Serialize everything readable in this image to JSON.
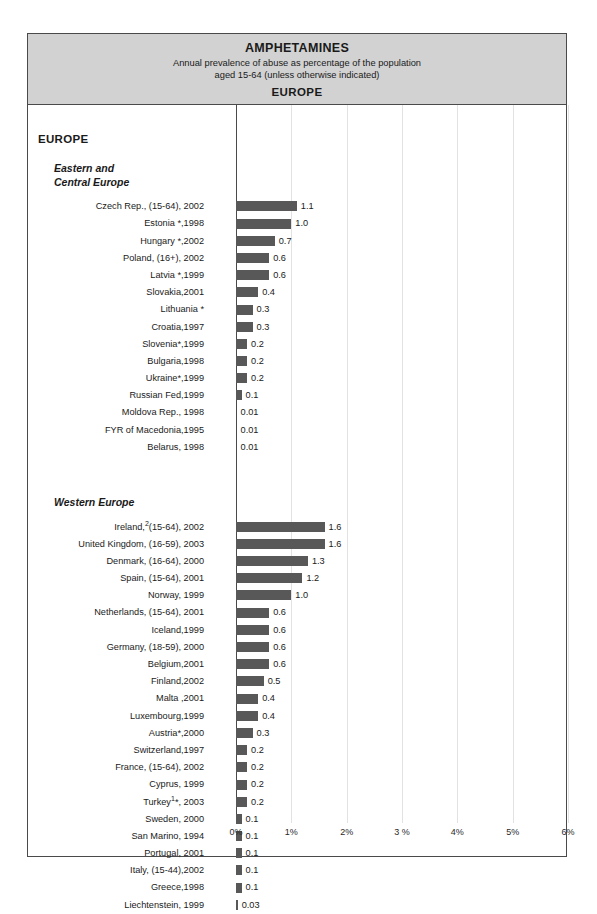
{
  "header": {
    "title": "AMPHETAMINES",
    "subtitle_line1": "Annual prevalence of abuse as percentage of the population",
    "subtitle_line2": "aged 15-64 (unless otherwise indicated)",
    "region": "EUROPE"
  },
  "colors": {
    "bar": "#585858",
    "header_background": "#d2d2d2",
    "frame_border": "#4a4a4a",
    "gridline": "#e2e2e2"
  },
  "sections": {
    "region_label": "EUROPE",
    "group1_line1": "Eastern and",
    "group1_line2": "Central Europe",
    "group2": "Western Europe"
  },
  "chart_data": {
    "type": "bar",
    "orientation": "horizontal",
    "title": "AMPHETAMINES",
    "subtitle": "Annual prevalence of abuse as percentage of the population aged 15-64 (unless otherwise indicated)",
    "region": "EUROPE",
    "xlabel": "",
    "ylabel": "",
    "xlim": [
      0,
      6
    ],
    "xticks": [
      0,
      1,
      2,
      3,
      4,
      5,
      6
    ],
    "xtick_labels": [
      "0%",
      "1%",
      "2%",
      "3 %",
      "4%",
      "5%",
      "6%"
    ],
    "grid": true,
    "legend": "none",
    "groups": [
      {
        "name": "Eastern and Central Europe",
        "categories": [
          "Czech Rep., (15-64), 2002",
          "Estonia *,1998",
          "Hungary *,2002",
          "Poland, (16+), 2002",
          "Latvia *,1999",
          "Slovakia,2001",
          "Lithuania *",
          "Croatia,1997",
          "Slovenia*,1999",
          "Bulgaria,1998",
          "Ukraine*,1999",
          "Russian Fed,1999",
          "Moldova Rep., 1998",
          "FYR of Macedonia,1995",
          "Belarus, 1998"
        ],
        "values": [
          1.1,
          1.0,
          0.7,
          0.6,
          0.6,
          0.4,
          0.3,
          0.3,
          0.2,
          0.2,
          0.2,
          0.1,
          0.01,
          0.01,
          0.01
        ],
        "value_labels": [
          "1.1",
          "1.0",
          "0.7",
          "0.6",
          "0.6",
          "0.4",
          "0.3",
          "0.3",
          "0.2",
          "0.2",
          "0.2",
          "0.1",
          "0.01",
          "0.01",
          "0.01"
        ]
      },
      {
        "name": "Western Europe",
        "categories": [
          "Ireland,²(15-64), 2002",
          "United Kingdom, (16-59), 2003",
          "Denmark, (16-64), 2000",
          "Spain, (15-64), 2001",
          "Norway,  1999",
          "Netherlands, (15-64), 2001",
          "Iceland,1999",
          "Germany, (18-59), 2000",
          "Belgium,2001",
          "Finland,2002",
          "Malta ,2001",
          "Luxembourg,1999",
          "Austria*,2000",
          "Switzerland,1997",
          "France, (15-64), 2002",
          "Cyprus, 1999",
          "Turkey¹*, 2003",
          "Sweden,  2000",
          "San Marino, 1994",
          "Portugal, 2001",
          "Italy, (15-44),2002",
          "Greece,1998",
          "Liechtenstein, 1999"
        ],
        "values": [
          1.6,
          1.6,
          1.3,
          1.2,
          1.0,
          0.6,
          0.6,
          0.6,
          0.6,
          0.5,
          0.4,
          0.4,
          0.3,
          0.2,
          0.2,
          0.2,
          0.2,
          0.1,
          0.1,
          0.1,
          0.1,
          0.1,
          0.03
        ],
        "value_labels": [
          "1.6",
          "1.6",
          "1.3",
          "1.2",
          "1.0",
          "0.6",
          "0.6",
          "0.6",
          "0.6",
          "0.5",
          "0.4",
          "0.4",
          "0.3",
          "0.2",
          "0.2",
          "0.2",
          "0.2",
          "0.1",
          "0.1",
          "0.1",
          "0.1",
          "0.1",
          "0.03"
        ]
      }
    ]
  }
}
